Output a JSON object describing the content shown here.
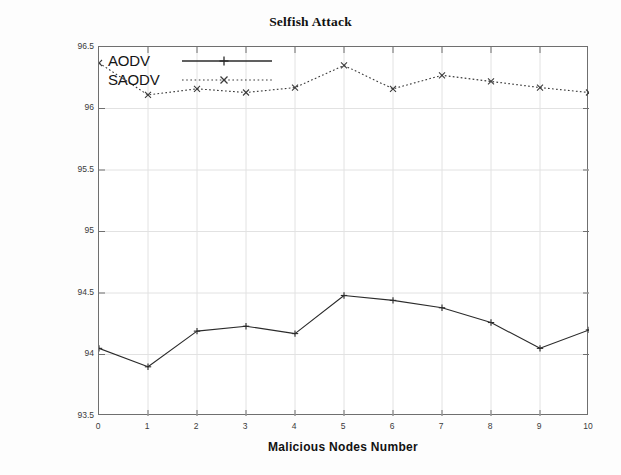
{
  "chart_data": {
    "type": "line",
    "title": "Selfish Attack",
    "xlabel": "Malicious Nodes Number",
    "ylabel": "Packet Delivery Ratio (PDR)",
    "x": [
      0,
      1,
      2,
      3,
      4,
      5,
      6,
      7,
      8,
      9,
      10
    ],
    "xtick_labels": [
      "0",
      "1",
      "2",
      "3",
      "4",
      "5",
      "6",
      "7",
      "8",
      "9",
      "10"
    ],
    "ytick_labels": [
      "93.5",
      "94",
      "94.5",
      "95",
      "95.5",
      "96",
      "96.5"
    ],
    "yticks": [
      93.5,
      94,
      94.5,
      95,
      95.5,
      96,
      96.5
    ],
    "xlim": [
      0,
      10
    ],
    "ylim": [
      93.5,
      96.5
    ],
    "grid": true,
    "legend_position": "top-left",
    "series": [
      {
        "name": "AODV",
        "linestyle": "solid",
        "marker": "plus",
        "color": "#2b2b2b",
        "values": [
          94.05,
          93.9,
          94.19,
          94.23,
          94.17,
          94.48,
          94.44,
          94.38,
          94.26,
          94.05,
          94.2
        ]
      },
      {
        "name": "SAODV",
        "linestyle": "dotted",
        "marker": "cross",
        "color": "#3a3a3a",
        "values": [
          96.37,
          96.11,
          96.16,
          96.13,
          96.17,
          96.35,
          96.16,
          96.27,
          96.22,
          96.17,
          96.13
        ]
      }
    ]
  },
  "figure": {
    "title": "Selfish Attack",
    "xlabel": "Malicious Nodes Number",
    "ylabel": "Packet Delivery Ratio (PDR)"
  },
  "legend": {
    "items": [
      {
        "label": "AODV",
        "sample_icon": "solid-line-plus-marker"
      },
      {
        "label": "SAODV",
        "sample_icon": "dotted-line-cross-marker"
      }
    ]
  },
  "colors": {
    "axis": "#6f6f6f",
    "grid": "#e2e2e2",
    "aodv": "#2b2b2b",
    "saodv": "#3a3a3a",
    "background": "#fdfdfd",
    "plot_background": "#ffffff"
  }
}
